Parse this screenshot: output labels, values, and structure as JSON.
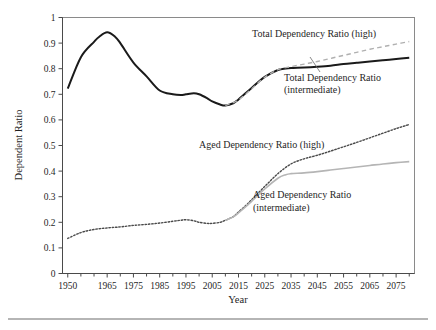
{
  "figure": {
    "ylabel": "Dependent Ratio",
    "xlabel": "Year",
    "source_note": ""
  },
  "annotations": {
    "total_high": "Total Dependency Ratio (high)",
    "total_intermediate_line1": "Total Dependency Ratio",
    "total_intermediate_line2": "(intermediate)",
    "aged_high": "Aged Dependency Ratio (high)",
    "aged_intermediate_line1": "Aged Dependency Ratio",
    "aged_intermediate_line2": "(intermediate)"
  },
  "colors": {
    "total_intermediate": "#1a1a1a",
    "total_high": "#b0b0b0",
    "aged_high": "#4a4a4a",
    "aged_intermediate": "#b5b5b5",
    "frame": "#8a8a8a"
  },
  "chart_data": {
    "type": "line",
    "title": "",
    "xlabel": "Year",
    "ylabel": "Dependent Ratio",
    "xlim": [
      1948,
      2082
    ],
    "ylim": [
      0,
      1
    ],
    "yticks": [
      0,
      0.1,
      0.2,
      0.3,
      0.4,
      0.5,
      0.6,
      0.7,
      0.8,
      0.9,
      1
    ],
    "ytick_labels": [
      "0",
      "0.1",
      "0.2",
      "0.3",
      "0.4",
      "0.5",
      "0.6",
      "0.7",
      "0.8",
      "0.9",
      "1"
    ],
    "xticks": [
      1950,
      1965,
      1975,
      1985,
      1995,
      2005,
      2015,
      2025,
      2035,
      2045,
      2055,
      2065,
      2075
    ],
    "xtick_labels": [
      "1950",
      "1965",
      "1975",
      "1985",
      "1995",
      "2005",
      "2015",
      "2025",
      "2035",
      "2045",
      "2055",
      "2065",
      "2075"
    ],
    "grid": false,
    "legend": "annotated-inline",
    "series": [
      {
        "name": "Total Dependency Ratio (intermediate)",
        "style": "solid",
        "color": "#1a1a1a",
        "width": 2.0,
        "x": [
          1950,
          1955,
          1960,
          1962,
          1965,
          1968,
          1970,
          1975,
          1980,
          1985,
          1990,
          1993,
          1995,
          1998,
          2000,
          2003,
          2005,
          2008,
          2010,
          2013,
          2015,
          2020,
          2025,
          2030,
          2033,
          2035,
          2040,
          2045,
          2050,
          2055,
          2060,
          2065,
          2070,
          2075,
          2080
        ],
        "y": [
          0.722,
          0.845,
          0.905,
          0.925,
          0.942,
          0.925,
          0.9,
          0.824,
          0.77,
          0.715,
          0.7,
          0.697,
          0.7,
          0.704,
          0.7,
          0.685,
          0.672,
          0.66,
          0.656,
          0.665,
          0.68,
          0.725,
          0.768,
          0.795,
          0.801,
          0.803,
          0.805,
          0.808,
          0.812,
          0.818,
          0.823,
          0.828,
          0.833,
          0.838,
          0.843
        ]
      },
      {
        "name": "Total Dependency Ratio (high)",
        "style": "dashed",
        "color": "#b0b0b0",
        "width": 1.4,
        "x": [
          2010,
          2015,
          2020,
          2025,
          2030,
          2035,
          2040,
          2045,
          2050,
          2055,
          2060,
          2065,
          2070,
          2075,
          2080
        ],
        "y": [
          0.656,
          0.678,
          0.722,
          0.766,
          0.796,
          0.808,
          0.818,
          0.828,
          0.84,
          0.852,
          0.864,
          0.876,
          0.886,
          0.896,
          0.906
        ]
      },
      {
        "name": "Aged Dependency Ratio (high)",
        "style": "dotted",
        "color": "#4a4a4a",
        "width": 1.4,
        "x": [
          1950,
          1955,
          1960,
          1965,
          1970,
          1975,
          1980,
          1985,
          1990,
          1993,
          1995,
          1998,
          2000,
          2003,
          2005,
          2008,
          2010,
          2013,
          2015,
          2018,
          2020,
          2025,
          2030,
          2035,
          2040,
          2045,
          2050,
          2055,
          2060,
          2065,
          2070,
          2075,
          2080
        ],
        "y": [
          0.137,
          0.16,
          0.172,
          0.178,
          0.182,
          0.188,
          0.192,
          0.197,
          0.204,
          0.208,
          0.21,
          0.206,
          0.2,
          0.196,
          0.196,
          0.2,
          0.208,
          0.222,
          0.24,
          0.268,
          0.288,
          0.34,
          0.39,
          0.428,
          0.448,
          0.462,
          0.478,
          0.495,
          0.512,
          0.53,
          0.548,
          0.566,
          0.582
        ]
      },
      {
        "name": "Aged Dependency Ratio (intermediate)",
        "style": "solid",
        "color": "#b5b5b5",
        "width": 1.6,
        "x": [
          2010,
          2013,
          2015,
          2018,
          2020,
          2025,
          2030,
          2033,
          2035,
          2040,
          2045,
          2050,
          2055,
          2060,
          2065,
          2070,
          2075,
          2080
        ],
        "y": [
          0.208,
          0.221,
          0.237,
          0.263,
          0.282,
          0.33,
          0.372,
          0.386,
          0.39,
          0.393,
          0.398,
          0.404,
          0.41,
          0.416,
          0.422,
          0.428,
          0.433,
          0.437
        ]
      }
    ]
  }
}
